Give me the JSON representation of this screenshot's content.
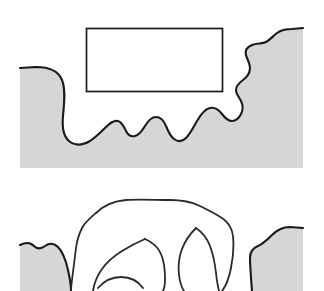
{
  "figure": {
    "title": "",
    "background_color": "#ffffff",
    "width": 324,
    "height": 291,
    "panel_count": 2
  },
  "colors": {
    "region_fill": "#d6d6d6",
    "region_outline": "#1a1a1a",
    "rectangle_outline": "#1a1a1a",
    "trace_outline": "#2a2a2a",
    "background": "#ffffff"
  },
  "panels": [
    {
      "id": "top-panel",
      "label": "",
      "description": "Shaded region with irregular wavy upper boundary and a rectangle overlay in the empty notch",
      "elements": [
        {
          "name": "shaded-region",
          "kind": "filled-region",
          "fill": "#d6d6d6",
          "outline": "#1a1a1a",
          "bounds": {
            "x": 20,
            "y": 28,
            "width": 284,
            "height": 140
          }
        },
        {
          "name": "overlay-rectangle",
          "kind": "rectangle",
          "fill": "none",
          "stroke": "#1a1a1a",
          "bounds": {
            "x": 86,
            "y": 28,
            "width": 137,
            "height": 64
          }
        }
      ]
    },
    {
      "id": "bottom-panel",
      "label": "",
      "description": "Freehand traced closed outline overlapping two shaded regions, cropped at the bottom edge",
      "elements": [
        {
          "name": "shaded-region-left",
          "kind": "filled-region",
          "fill": "#d6d6d6",
          "outline": "#1a1a1a",
          "bounds": {
            "x": 20,
            "y": 243,
            "width": 52,
            "height": 48
          }
        },
        {
          "name": "shaded-region-right",
          "kind": "filled-region",
          "fill": "#d6d6d6",
          "outline": "#1a1a1a",
          "bounds": {
            "x": 250,
            "y": 227,
            "width": 54,
            "height": 64
          }
        },
        {
          "name": "traced-outline",
          "kind": "freehand-closed-curve",
          "fill": "none",
          "stroke": "#2a2a2a",
          "bounds": {
            "x": 68,
            "y": 198,
            "width": 168,
            "height": 93
          }
        }
      ]
    }
  ],
  "annotations": {
    "top_panel_caption": "",
    "bottom_panel_caption": ""
  }
}
